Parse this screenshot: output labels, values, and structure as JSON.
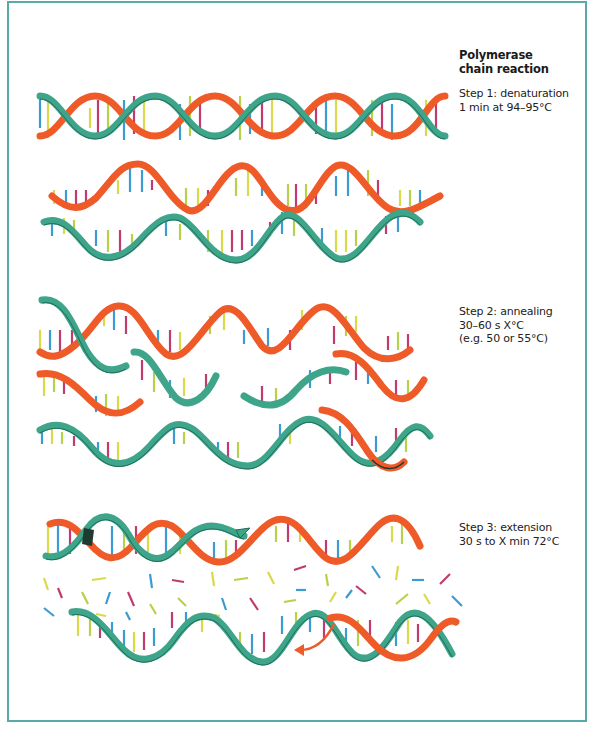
{
  "diagram": {
    "title_line1": "Polymerase",
    "title_line2": "chain reaction",
    "steps": [
      {
        "name": "denaturation",
        "line1": "Step 1: denaturation",
        "line2": "1 min at 94–95°C"
      },
      {
        "name": "annealing",
        "line1": "Step 2: annealing",
        "line2": "30–60 s X°C",
        "line3": "(e.g. 50 or 55°C)"
      },
      {
        "name": "extension",
        "line1": "Step 3: extension",
        "line2": "30 s to X min 72°C"
      }
    ],
    "colors": {
      "strand_red": "#ee5a28",
      "strand_green": "#3fa58a",
      "strand_green_dark": "#1f6b56",
      "base_yellow": "#d9d94a",
      "base_blue": "#3c9bd0",
      "base_magenta": "#c03b6e",
      "base_lime": "#b6d24a",
      "frame": "#5aa9a8"
    }
  }
}
